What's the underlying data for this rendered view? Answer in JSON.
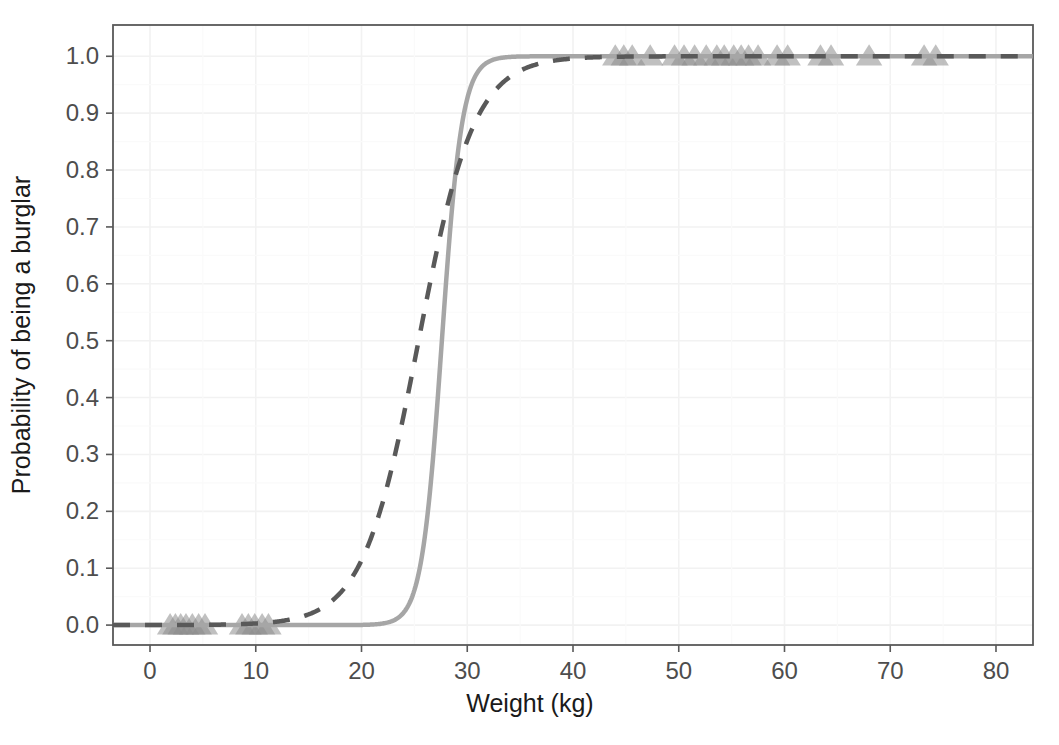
{
  "chart_data": {
    "type": "line",
    "title": "",
    "xlabel": "Weight (kg)",
    "ylabel": "Probability of being a burglar",
    "xlim": [
      -3.5,
      83.5
    ],
    "ylim": [
      -0.035,
      1.055
    ],
    "xticks": [
      0,
      10,
      20,
      30,
      40,
      50,
      60,
      70,
      80
    ],
    "xticklabels": [
      "0",
      "10",
      "20",
      "30",
      "40",
      "50",
      "60",
      "70",
      "80"
    ],
    "yticks": [
      0.0,
      0.1,
      0.2,
      0.3,
      0.4,
      0.5,
      0.6,
      0.7,
      0.8,
      0.9,
      1.0
    ],
    "yticklabels": [
      "0.0",
      "0.1",
      "0.2",
      "0.3",
      "0.4",
      "0.5",
      "0.6",
      "0.7",
      "0.8",
      "0.9",
      "1.0"
    ],
    "grid": true,
    "legend": "none",
    "background": "#ffffff",
    "panel_border_color": "#595959",
    "grid_color": "#f2f2f2",
    "series": [
      {
        "name": "steep-logistic-solid",
        "style": "solid",
        "color": "#a6a6a6",
        "linewidth": 4.5,
        "model": "logistic",
        "midpoint": 27.6,
        "slope": 1.05,
        "description": "Solid light-grey logistic curve rising sharply near 28 kg"
      },
      {
        "name": "shallow-logistic-dashed",
        "style": "dashed",
        "color": "#595959",
        "linewidth": 4.5,
        "model": "logistic",
        "midpoint": 25.4,
        "slope": 0.38,
        "description": "Dashed dark-grey logistic curve rising more gradually, midpoint near 25 kg"
      }
    ],
    "points": {
      "name": "observations",
      "marker": "triangle",
      "color": "#8c8c8c",
      "opacity": 0.55,
      "size": 15,
      "x": [
        1.9,
        2.4,
        2.9,
        3.4,
        4.0,
        4.6,
        5.2,
        8.7,
        9.3,
        9.9,
        10.6,
        11.2,
        44.0,
        44.8,
        45.6,
        47.3,
        49.6,
        50.5,
        51.5,
        52.6,
        53.6,
        54.3,
        55.2,
        55.9,
        56.6,
        57.5,
        59.3,
        60.3,
        63.4,
        64.4,
        68.0,
        73.2,
        74.3
      ],
      "y": [
        0,
        0,
        0,
        0,
        0,
        0,
        0,
        0,
        0,
        0,
        0,
        0,
        1,
        1,
        1,
        1,
        1,
        1,
        1,
        1,
        1,
        1,
        1,
        1,
        1,
        1,
        1,
        1,
        1,
        1,
        1,
        1,
        1
      ]
    }
  },
  "axes": {
    "x_title": "Weight (kg)",
    "y_title": "Probability of being a burglar"
  }
}
